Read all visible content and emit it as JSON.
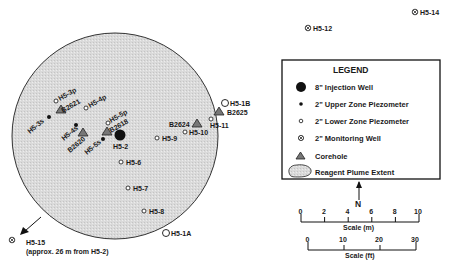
{
  "plume": {
    "label": "Reagent Plume Extent",
    "fill": "#d9d9d9",
    "stroke": "#333333"
  },
  "wells": {
    "injection": [
      {
        "id": "H5-2",
        "label": "H5-2"
      }
    ],
    "upper_zone_piezometers": [
      {
        "id": "H5-3s",
        "label": "H5-3s"
      },
      {
        "id": "H5-4s",
        "label": "H5-4s"
      },
      {
        "id": "H5-5s",
        "label": "H5-5s"
      }
    ],
    "lower_zone_piezometers": [
      {
        "id": "H5-3p",
        "label": "H5-3p"
      },
      {
        "id": "H5-4p",
        "label": "H5-4p"
      },
      {
        "id": "H5-5p",
        "label": "H5-5p"
      },
      {
        "id": "H5-6",
        "label": "H5-6"
      },
      {
        "id": "H5-7",
        "label": "H5-7"
      },
      {
        "id": "H5-8",
        "label": "H5-8"
      },
      {
        "id": "H5-9",
        "label": "H5-9"
      },
      {
        "id": "H5-10",
        "label": "H5-10"
      },
      {
        "id": "H5-11",
        "label": "H5-11"
      },
      {
        "id": "H5-1A",
        "label": "H5-1A"
      },
      {
        "id": "H5-1B",
        "label": "H5-1B"
      }
    ],
    "monitoring_wells": [
      {
        "id": "H5-12",
        "label": "H5-12"
      },
      {
        "id": "H5-14",
        "label": "H5-14"
      },
      {
        "id": "H5-15",
        "label": "H5-15",
        "note": "(approx. 26 m from H5-2)"
      }
    ],
    "coreholes": [
      {
        "id": "B2621",
        "label": "B2621"
      },
      {
        "id": "B2620",
        "label": "B2620"
      },
      {
        "id": "B2618",
        "label": "B2618"
      },
      {
        "id": "B2624",
        "label": "B2624"
      },
      {
        "id": "B2625",
        "label": "B2625"
      }
    ]
  },
  "legend": {
    "title": "LEGEND",
    "items": [
      {
        "symbol": "injection-well",
        "label": "8\" Injection Well"
      },
      {
        "symbol": "upper-zone-piezometer",
        "label": "2\" Upper Zone Piezometer"
      },
      {
        "symbol": "lower-zone-piezometer",
        "label": "2\" Lower Zone Piezometer"
      },
      {
        "symbol": "monitoring-well",
        "label": "2\" Monitoring Well"
      },
      {
        "symbol": "corehole",
        "label": "Corehole"
      },
      {
        "symbol": "plume",
        "label": "Reagent Plume Extent"
      }
    ]
  },
  "north_arrow": {
    "label": "N"
  },
  "scale_m": {
    "label": "Scale (m)",
    "ticks": [
      "0",
      "2",
      "4",
      "6",
      "8",
      "10"
    ]
  },
  "scale_ft": {
    "label": "Scale (ft)",
    "ticks": [
      "0",
      "10",
      "20",
      "30"
    ]
  }
}
